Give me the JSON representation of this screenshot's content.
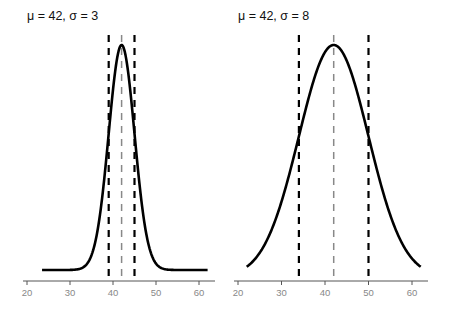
{
  "chart_data": [
    {
      "type": "line",
      "title": "μ = 42, σ = 3",
      "mu": 42,
      "sigma": 3,
      "xlabel": "",
      "ylabel": "",
      "xlim": [
        20,
        62
      ],
      "x_ticks": [
        20,
        30,
        40,
        50,
        60
      ],
      "x_tick_labels": [
        "20",
        "30",
        "40",
        "50",
        "60"
      ],
      "curve": "normal density",
      "vertical_lines": [
        {
          "x": 39,
          "style": "dashed",
          "color": "#000000",
          "label": "μ - σ"
        },
        {
          "x": 42,
          "style": "dashed",
          "color": "#888888",
          "label": "μ"
        },
        {
          "x": 45,
          "style": "dashed",
          "color": "#000000",
          "label": "μ + σ"
        }
      ],
      "grid": false,
      "y_axis_shown": false
    },
    {
      "type": "line",
      "title": "μ = 42, σ = 8",
      "mu": 42,
      "sigma": 8,
      "xlabel": "",
      "ylabel": "",
      "xlim": [
        22,
        62
      ],
      "x_ticks": [
        20,
        30,
        40,
        50,
        60
      ],
      "x_tick_labels": [
        "20",
        "30",
        "40",
        "50",
        "60"
      ],
      "curve": "normal density",
      "vertical_lines": [
        {
          "x": 34,
          "style": "dashed",
          "color": "#000000",
          "label": "μ - σ"
        },
        {
          "x": 42,
          "style": "dashed",
          "color": "#888888",
          "label": "μ"
        },
        {
          "x": 50,
          "style": "dashed",
          "color": "#000000",
          "label": "μ + σ"
        }
      ],
      "grid": false,
      "y_axis_shown": false
    }
  ],
  "panels": [
    {
      "title": "μ = 42, σ = 3"
    },
    {
      "title": "μ = 42, σ = 8"
    }
  ]
}
